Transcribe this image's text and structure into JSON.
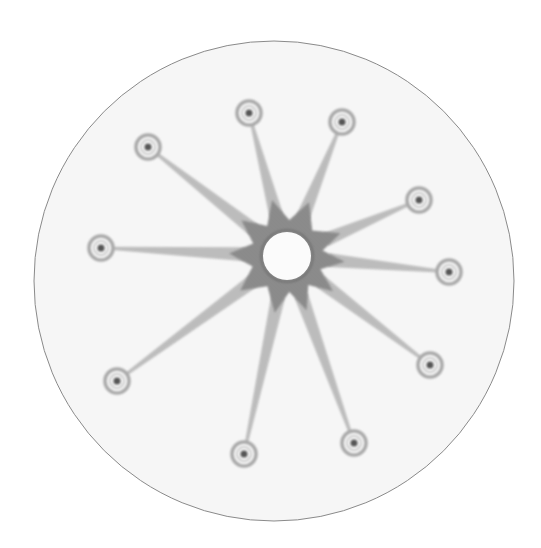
{
  "image": {
    "description": "Embroidered hoop-like circular artwork: a central grey star-shaped hub with a white hole, radiating thin stitched spokes ending in small ringed nodes",
    "canvas": {
      "width": 541,
      "height": 548,
      "background": "#ffffff"
    },
    "disc": {
      "cx": 274,
      "cy": 281,
      "r": 240,
      "fill": "#f6f6f6",
      "stroke": "#8a8a8a",
      "stroke_width": 1
    },
    "hub": {
      "cx": 287,
      "cy": 256,
      "outer_r": 50,
      "inner_hole_r": 24,
      "points": 9,
      "fill": "#909090",
      "hole_fill": "#fbfbfb"
    },
    "spoke_color": "#b3b3b3",
    "node_ring_color": "#a8a8a8",
    "node_dot_color": "#555555",
    "node_ring_r": 11,
    "node_dot_r": 3.5,
    "nodes": [
      {
        "name": "node-top-left",
        "x": 148,
        "y": 147
      },
      {
        "name": "node-top",
        "x": 249,
        "y": 113
      },
      {
        "name": "node-top-right",
        "x": 342,
        "y": 122
      },
      {
        "name": "node-right-upper",
        "x": 419,
        "y": 200
      },
      {
        "name": "node-right",
        "x": 449,
        "y": 272
      },
      {
        "name": "node-right-lower",
        "x": 430,
        "y": 365
      },
      {
        "name": "node-bottom-right",
        "x": 354,
        "y": 443
      },
      {
        "name": "node-bottom",
        "x": 244,
        "y": 454
      },
      {
        "name": "node-bottom-left",
        "x": 117,
        "y": 381
      },
      {
        "name": "node-left",
        "x": 101,
        "y": 248
      }
    ]
  }
}
